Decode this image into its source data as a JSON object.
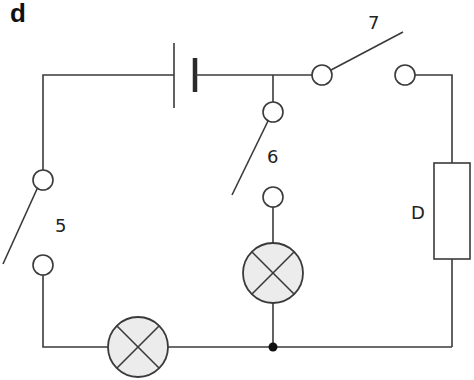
{
  "figure": {
    "panel_label": "d",
    "colors": {
      "wire": "#3a3a3a",
      "lamp_fill": "#ececec",
      "background": "#ffffff"
    }
  },
  "components": {
    "battery": {
      "type": "cell"
    },
    "switch_5": {
      "label": "5",
      "state": "open"
    },
    "switch_6": {
      "label": "6",
      "state": "open"
    },
    "switch_7": {
      "label": "7",
      "state": "open"
    },
    "lamp_1": {
      "type": "lamp",
      "position": "bottom wire"
    },
    "lamp_2": {
      "type": "lamp",
      "position": "middle branch"
    },
    "component_d": {
      "label": "D",
      "type": "resistor"
    },
    "junction": {
      "type": "node"
    }
  }
}
